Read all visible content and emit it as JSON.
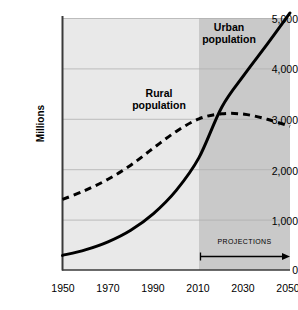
{
  "chart_data": {
    "type": "line",
    "title": "",
    "xlabel": "",
    "ylabel": "Millions",
    "xlim": [
      1950,
      2050
    ],
    "ylim": [
      0,
      5000
    ],
    "grid": true,
    "legend_position": "inline-annotations",
    "x_ticks": [
      "1950",
      "1970",
      "1990",
      "2010",
      "2030",
      "2050"
    ],
    "y_ticks": [
      "0",
      "1,000",
      "2,000",
      "3,000",
      "4,000",
      "5,000"
    ],
    "x": [
      1950,
      1960,
      1970,
      1980,
      1990,
      2000,
      2010,
      2020,
      2030,
      2040,
      2050
    ],
    "series": [
      {
        "name": "Urban population",
        "style": "solid",
        "color": "#000000",
        "values": [
          290,
          400,
          560,
          790,
          1120,
          1580,
          2230,
          3230,
          3880,
          4480,
          5100
        ]
      },
      {
        "name": "Rural population",
        "style": "dashed",
        "color": "#000000",
        "values": [
          1400,
          1580,
          1800,
          2080,
          2420,
          2750,
          3000,
          3100,
          3090,
          2990,
          2850
        ]
      }
    ],
    "annotations": [
      {
        "name": "urban-label",
        "text": "Urban\npopulation",
        "line1": "Urban",
        "line2": "population"
      },
      {
        "name": "rural-label",
        "text": "Rural\npopulation",
        "line1": "Rural",
        "line2": "population"
      },
      {
        "name": "projections",
        "text": "PROJECTIONS",
        "span_start": 2010,
        "span_end": 2050
      }
    ],
    "shaded_regions": [
      {
        "name": "historical",
        "from": 1950,
        "to": 2010,
        "color": "#e9e9e9"
      },
      {
        "name": "projection",
        "from": 2010,
        "to": 2050,
        "color": "#c9c9c9"
      }
    ]
  },
  "axes": {
    "y_title": "Millions",
    "y_ticks": [
      {
        "label": "5,000",
        "value": 5000
      },
      {
        "label": "4,000",
        "value": 4000
      },
      {
        "label": "3,000",
        "value": 3000
      },
      {
        "label": "2,000",
        "value": 2000
      },
      {
        "label": "1,000",
        "value": 1000
      },
      {
        "label": "0",
        "value": 0
      }
    ],
    "x_ticks": [
      {
        "label": "1950",
        "value": 1950
      },
      {
        "label": "1970",
        "value": 1970
      },
      {
        "label": "1990",
        "value": 1990
      },
      {
        "label": "2010",
        "value": 2010
      },
      {
        "label": "2030",
        "value": 2030
      },
      {
        "label": "2050",
        "value": 2050
      }
    ]
  },
  "labels": {
    "urban_line1": "Urban",
    "urban_line2": "population",
    "rural_line1": "Rural",
    "rural_line2": "population",
    "projections": "PROJECTIONS"
  },
  "colors": {
    "background": "#ffffff",
    "plot_historical": "#e9e9e9",
    "plot_projection": "#c9c9c9",
    "gridline": "#b6b6b6",
    "axis": "#3a3a3a",
    "series": "#000000"
  }
}
